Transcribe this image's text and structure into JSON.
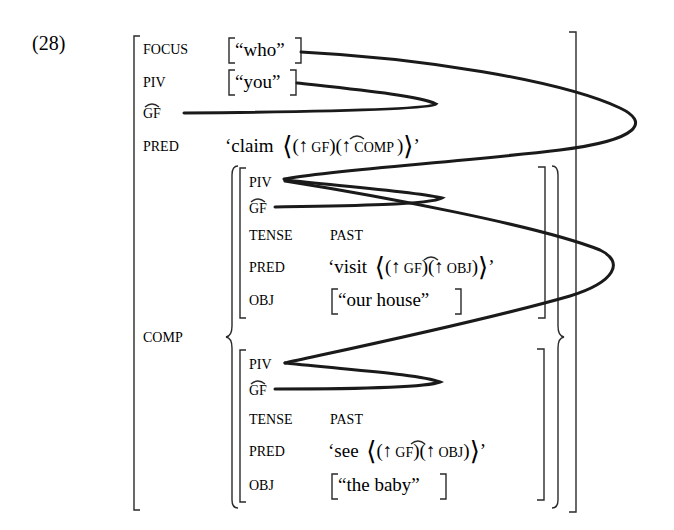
{
  "example_number": "(28)",
  "outer": {
    "focus": {
      "attr": "FOCUS",
      "value": "“who”"
    },
    "piv": {
      "attr": "PIV",
      "value": "“you”"
    },
    "gf": {
      "attr": "GF",
      "hat": "^"
    },
    "pred": {
      "attr": "PRED",
      "value_prefix": "‘claim",
      "arg1": "(↑",
      "arg1_gf": "GF",
      "arg1_close": ")",
      "arg2": "(↑",
      "arg2_feat": "COMP",
      "arg2_close": ")",
      "close": "’"
    },
    "comp": {
      "attr": "COMP"
    }
  },
  "conjunct1": {
    "piv": {
      "attr": "PIV"
    },
    "gf": {
      "attr": "GF"
    },
    "tense": {
      "attr": "TENSE",
      "value": "PAST"
    },
    "pred": {
      "attr": "PRED",
      "value_prefix": "‘visit",
      "arg1": "(↑",
      "arg1_gf": "GF",
      "arg1_close": ")",
      "arg2": "(↑",
      "arg2_feat": "OBJ",
      "arg2_close": ")",
      "close": "’"
    },
    "obj": {
      "attr": "OBJ",
      "value": "“our house”"
    }
  },
  "conjunct2": {
    "piv": {
      "attr": "PIV"
    },
    "gf": {
      "attr": "GF"
    },
    "tense": {
      "attr": "TENSE",
      "value": "PAST"
    },
    "pred": {
      "attr": "PRED",
      "value_prefix": "‘see",
      "arg1": "(↑",
      "arg1_gf": "GF",
      "arg1_close": ")",
      "arg2": "(↑",
      "arg2_feat": "OBJ",
      "arg2_close": ")",
      "close": "’"
    },
    "obj": {
      "attr": "OBJ",
      "value": "“the baby”"
    }
  },
  "angle_open": "⟨",
  "angle_close": "⟩",
  "colors": {
    "ink": "#2a2a2a",
    "line": "#1a1a1a",
    "background": "#ffffff"
  }
}
